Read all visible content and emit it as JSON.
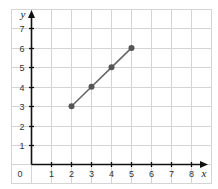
{
  "chart_data": {
    "type": "line",
    "title": "",
    "xlabel": "x",
    "ylabel": "y",
    "xlim": [
      0,
      8
    ],
    "ylim": [
      0,
      7
    ],
    "grid": true,
    "x_ticks": [
      "0",
      "1",
      "2",
      "3",
      "4",
      "5",
      "6",
      "7",
      "8"
    ],
    "y_ticks": [
      "1",
      "2",
      "3",
      "4",
      "5",
      "6",
      "7"
    ],
    "series": [
      {
        "name": "line",
        "color": "#666666",
        "marker_color": "#555555",
        "points": [
          [
            2,
            3
          ],
          [
            3,
            4
          ],
          [
            4,
            5
          ],
          [
            5,
            6
          ]
        ]
      }
    ]
  },
  "labels": {
    "origin": "0",
    "x_axis": "x",
    "y_axis": "y",
    "x1": "1",
    "x2": "2",
    "x3": "3",
    "x4": "4",
    "x5": "5",
    "x6": "6",
    "x7": "7",
    "x8": "8",
    "y1": "1",
    "y2": "2",
    "y3": "3",
    "y4": "4",
    "y5": "5",
    "y6": "6",
    "y7": "7"
  }
}
